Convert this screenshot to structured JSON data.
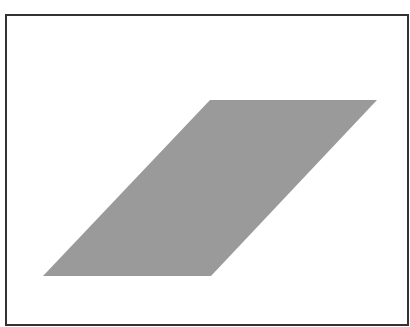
{
  "figure": {
    "frame": {
      "border_color": "#333333",
      "background": "#ffffff"
    },
    "shape": {
      "type": "parallelogram",
      "fill": "#9a9a9a",
      "points": [
        [
          210,
          100
        ],
        [
          377,
          100
        ],
        [
          211,
          276
        ],
        [
          43,
          276
        ]
      ]
    }
  }
}
